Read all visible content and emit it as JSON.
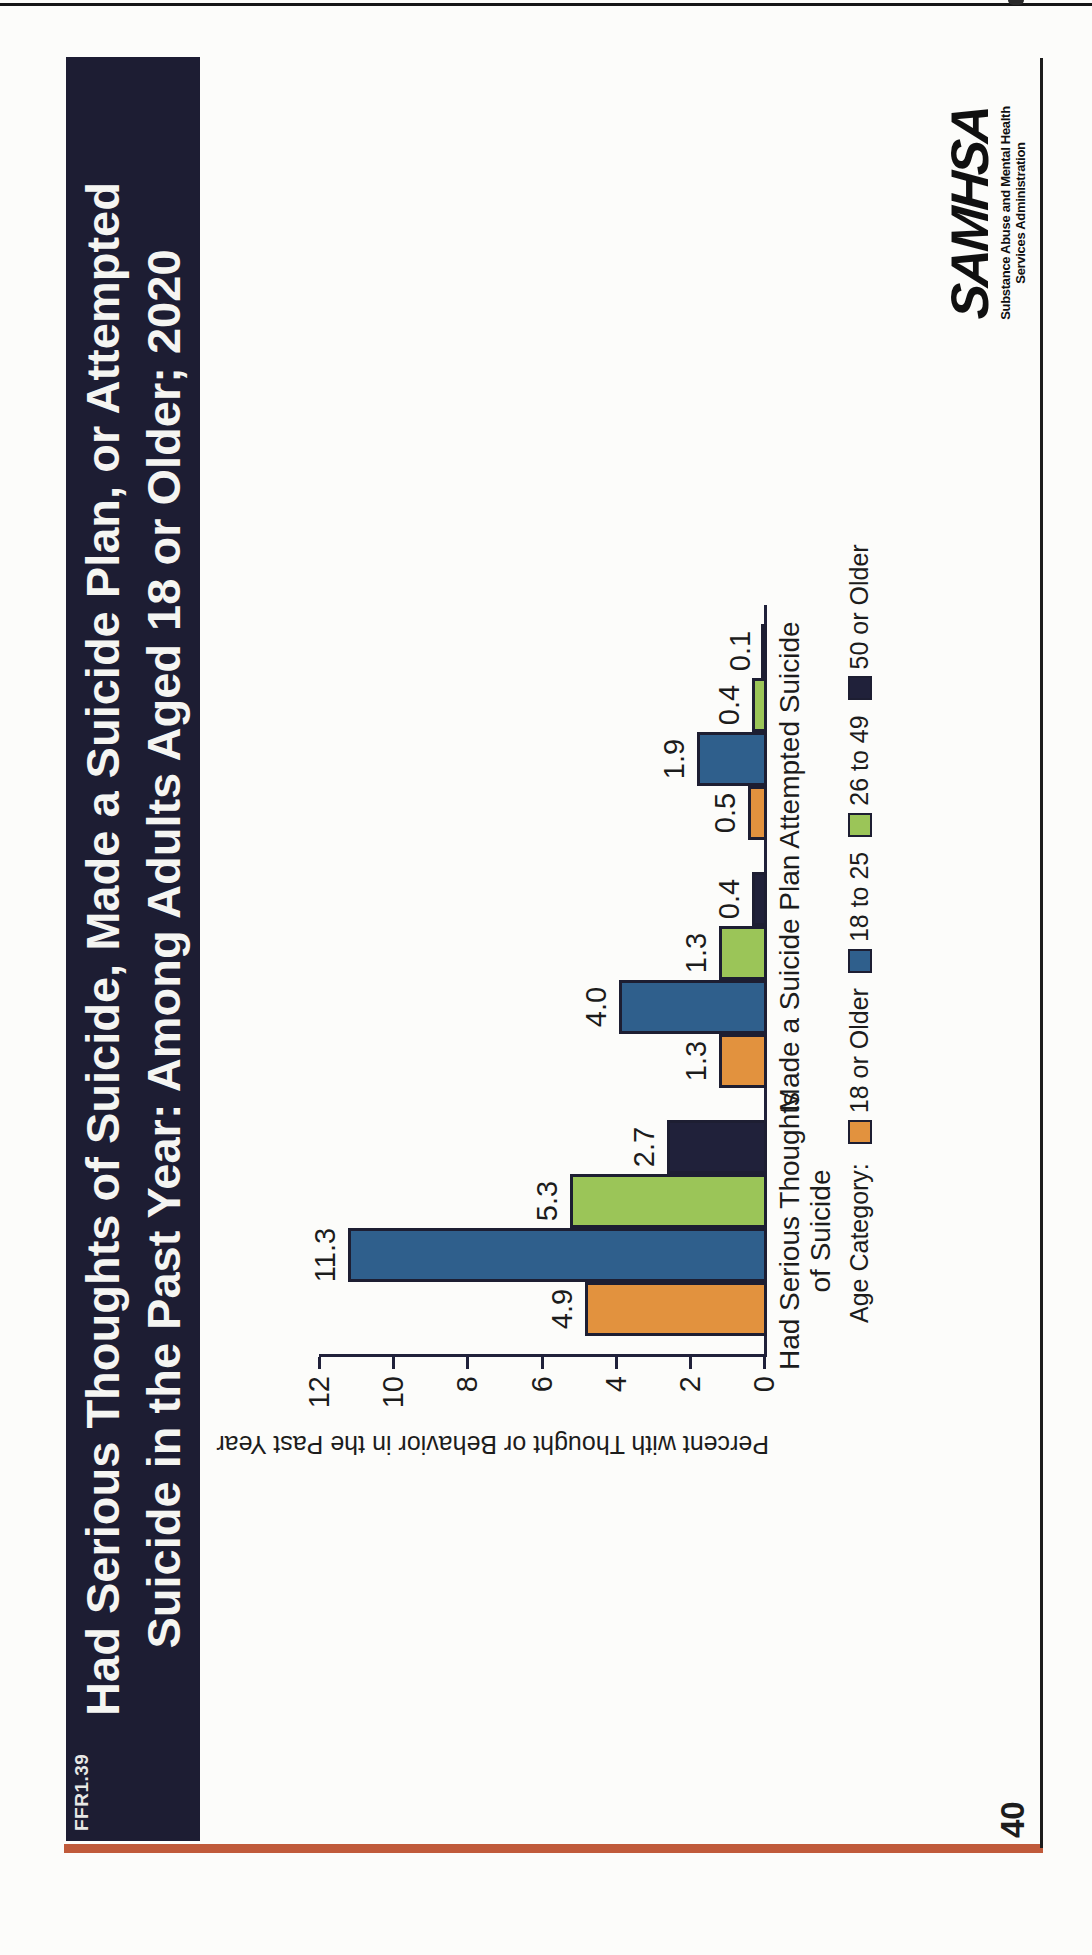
{
  "page": {
    "number": "40",
    "figure_code": "FFR1.39"
  },
  "title": {
    "lines": [
      "Had Serious Thoughts of Suicide, Made a Suicide Plan, or Attempted",
      "Suicide in the Past Year: Among Adults Aged 18 or Older; 2020"
    ]
  },
  "logo": {
    "name": "SAMHSA",
    "tagline_line1": "Substance Abuse and Mental Health",
    "tagline_line2": "Services Administration"
  },
  "legend": {
    "label": "Age Category:"
  },
  "colors": {
    "title_bar": "#1d1d33",
    "accent_line": "#c05a3a",
    "bar_outline": "#1d1e32"
  },
  "chart_data": {
    "type": "bar",
    "title": "",
    "categories": [
      "Had Serious Thoughts of Suicide",
      "Made a Suicide Plan",
      "Attempted Suicide"
    ],
    "category_display_lines": [
      [
        "Had Serious Thoughts",
        "of Suicide"
      ],
      [
        "Made a Suicide Plan"
      ],
      [
        "Attempted Suicide"
      ]
    ],
    "series": [
      {
        "name": "18 or Older",
        "color": "#e2923e",
        "values": [
          4.9,
          1.3,
          0.5
        ]
      },
      {
        "name": "18 to 25",
        "color": "#2f5f8c",
        "values": [
          11.3,
          4.0,
          1.9
        ]
      },
      {
        "name": "26 to 49",
        "color": "#9bc558",
        "values": [
          5.3,
          1.3,
          0.4
        ]
      },
      {
        "name": "50 or Older",
        "color": "#20213a",
        "values": [
          2.7,
          0.4,
          0.1
        ]
      }
    ],
    "xlabel": "",
    "ylabel": "Percent with Thought or Behavior in the Past Year",
    "ylim": [
      0,
      12
    ],
    "yticks": [
      0,
      2,
      4,
      6,
      8,
      10,
      12
    ],
    "grid": false,
    "bar_value_labels": true,
    "legend_position": "below-chart"
  }
}
